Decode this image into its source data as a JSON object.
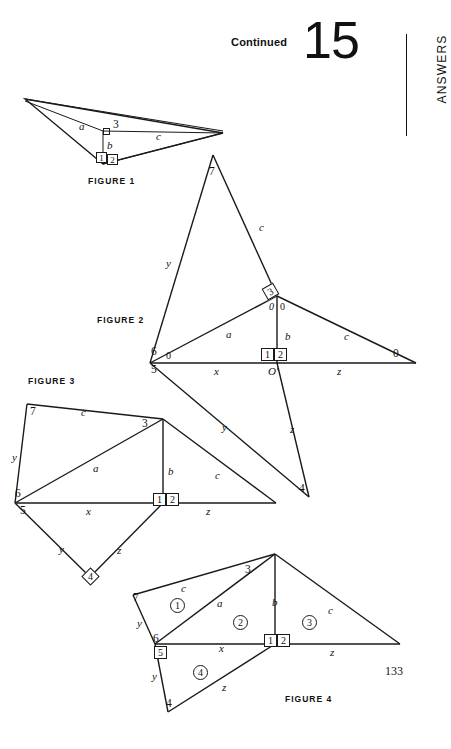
{
  "header": {
    "continued_label": "Continued",
    "answer_number": "15",
    "section_label": "ANSWERS"
  },
  "page_number": "133",
  "figures": [
    {
      "id": "figure-1",
      "caption": "FIGURE 1",
      "labels": {
        "a": "a",
        "b": "b",
        "c": "c",
        "angle3": "3",
        "angle1": "1",
        "angle2": "2"
      }
    },
    {
      "id": "figure-2",
      "caption": "FIGURE 2",
      "labels": {
        "v7": "7",
        "c_upper": "c",
        "y_left": "y",
        "angle3": "3",
        "zero_left": "0",
        "zero_right": "0",
        "a": "a",
        "b": "b",
        "c_right": "c",
        "zero_far_right": "0",
        "v6": "6",
        "zero_at_6": "0",
        "v5": "5",
        "x": "x",
        "origin": "O'",
        "z_base": "z",
        "angle1": "1",
        "angle2": "2",
        "y_lower": "y",
        "z_lower": "z",
        "v4": "4"
      }
    },
    {
      "id": "figure-3",
      "caption": "FIGURE 3",
      "labels": {
        "v7": "7",
        "c_top": "c",
        "angle3": "3",
        "y_left": "y",
        "a": "a",
        "b": "b",
        "c_right": "c",
        "v6": "6",
        "v5": "5",
        "x": "x",
        "angle1": "1",
        "angle2": "2",
        "z_base": "z",
        "y_lower": "y",
        "z_lower": "z",
        "v4": "4"
      }
    },
    {
      "id": "figure-4",
      "caption": "FIGURE 4",
      "labels": {
        "v7": "7",
        "c_top": "c",
        "angle3": "3",
        "y_left": "y",
        "a": "a",
        "b": "b",
        "c_right": "c",
        "v6": "6",
        "angle5": "5",
        "x": "x",
        "angle1": "1",
        "angle2": "2",
        "z_base": "z",
        "y_lower": "y",
        "z_lower": "z",
        "v4": "4",
        "region1": "1",
        "region2": "2",
        "region3": "3",
        "region4": "4"
      }
    }
  ]
}
